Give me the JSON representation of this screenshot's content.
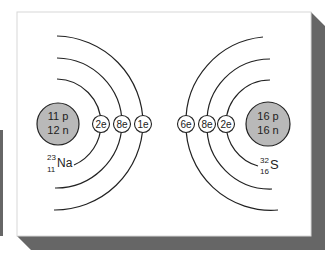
{
  "diagram": {
    "colors": {
      "background": "#ffffff",
      "panel": "#ffffff",
      "panel_border": "#d8d8d8",
      "shadow": "#666666",
      "nucleus_fill": "#b9b9b9",
      "line": "#222222"
    },
    "atoms": [
      {
        "id": "sodium",
        "symbol": "Na",
        "mass_number": "23",
        "atomic_number": "11",
        "nucleus": {
          "protons": "11 p",
          "neutrons": "12 n"
        },
        "shells": [
          {
            "label": "2e"
          },
          {
            "label": "8e"
          },
          {
            "label": "1e"
          }
        ]
      },
      {
        "id": "sulfur",
        "symbol": "S",
        "mass_number": "32",
        "atomic_number": "16",
        "nucleus": {
          "protons": "16 p",
          "neutrons": "16 n"
        },
        "shells": [
          {
            "label": "2e"
          },
          {
            "label": "8e"
          },
          {
            "label": "6e"
          }
        ]
      }
    ]
  }
}
